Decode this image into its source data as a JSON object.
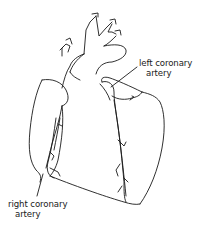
{
  "figure": {
    "line_color": "#1a1a1a",
    "background": "#ffffff"
  },
  "labels": {
    "left_coronary_artery": {
      "line1": "left coronary",
      "line2": "artery"
    },
    "right_coronary_artery": {
      "line1": "right coronary",
      "line2": "artery"
    }
  }
}
